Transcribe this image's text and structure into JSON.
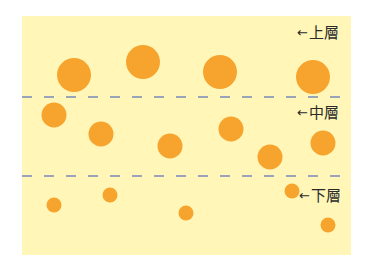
{
  "diagram": {
    "background_color": "#fff6b8",
    "particle_color": "#f7a42e",
    "divider_color": "#9aa4b8",
    "layers": [
      {
        "id": "upper",
        "label": "上層",
        "arrow": "←",
        "particle_size": "large",
        "particle_count": 4
      },
      {
        "id": "middle",
        "label": "中層",
        "arrow": "←",
        "particle_size": "medium",
        "particle_count": 6
      },
      {
        "id": "lower",
        "label": "下層",
        "arrow": "←",
        "particle_size": "small",
        "particle_count": 5
      }
    ],
    "dividers": [
      {
        "between": [
          "upper",
          "middle"
        ],
        "style": "dashed"
      },
      {
        "between": [
          "middle",
          "lower"
        ],
        "style": "dashed"
      }
    ]
  }
}
